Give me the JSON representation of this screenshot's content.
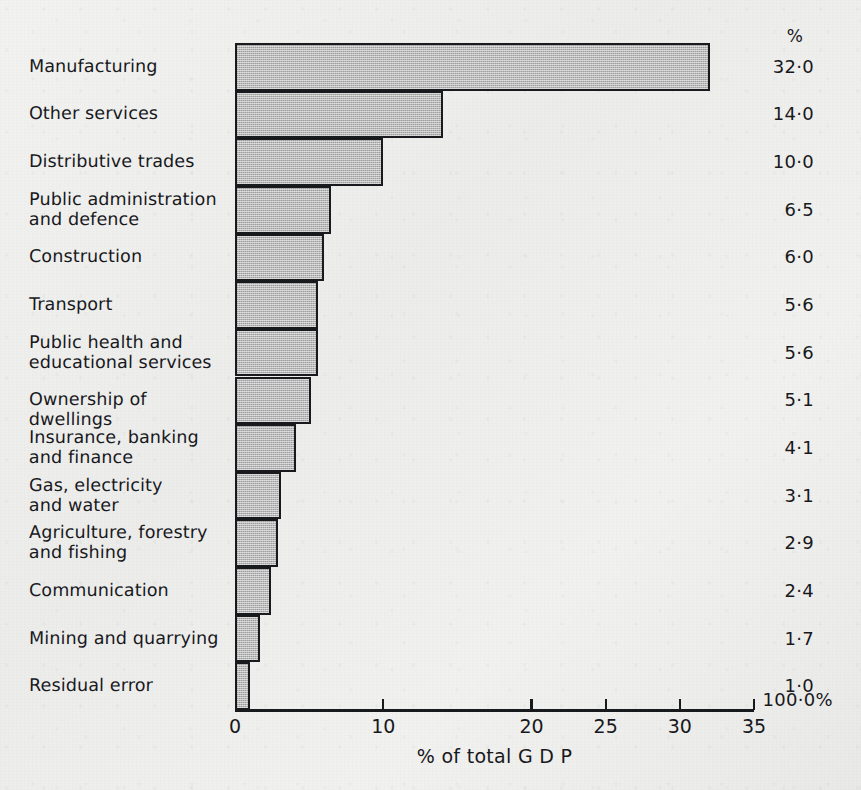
{
  "chart_data": {
    "type": "bar",
    "orientation": "horizontal",
    "title": "",
    "xlabel": "% of total G D P",
    "ylabel": "",
    "xlim": [
      0,
      35
    ],
    "xticks": [
      0,
      10,
      20,
      25,
      30,
      35
    ],
    "xtick_labels": [
      "0",
      "10",
      "20",
      "25",
      "30",
      "35"
    ],
    "grid": false,
    "legend": null,
    "value_column_header": "%",
    "value_column_total": "100·0%",
    "categories": [
      "Manufacturing",
      "Other services",
      "Distributive trades",
      "Public administration\nand defence",
      "Construction",
      "Transport",
      "Public health and\neducational services",
      "Ownership of dwellings",
      "Insurance, banking\nand finance",
      "Gas, electricity\nand water",
      "Agriculture, forestry\nand fishing",
      "Communication",
      "Mining and quarrying",
      "Residual error"
    ],
    "values": [
      32.0,
      14.0,
      10.0,
      6.5,
      6.0,
      5.6,
      5.6,
      5.1,
      4.1,
      3.1,
      2.9,
      2.4,
      1.7,
      1.0
    ],
    "value_labels": [
      "32·0",
      "14·0",
      "10·0",
      "6·5",
      "6·0",
      "5·6",
      "5·6",
      "5·1",
      "4·1",
      "3·1",
      "2·9",
      "2·4",
      "1·7",
      "1·0"
    ]
  },
  "style": {
    "bar_fill": "#b9b9b9",
    "bar_stroke": "#17181c",
    "text_color": "#16171b",
    "paper": "#efefee"
  }
}
